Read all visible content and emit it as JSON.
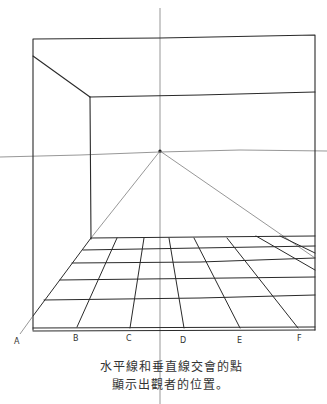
{
  "diagram": {
    "type": "one-point-perspective-sketch",
    "vanishing_point": {
      "x": 160,
      "y": 152
    },
    "horizon_line_y": 155,
    "vertical_line_x": 160,
    "floor_labels": [
      "A",
      "B",
      "C",
      "D",
      "E",
      "F"
    ],
    "caption_lines": [
      "水平線和垂直線交會的點",
      "顯示出觀者的位置。"
    ]
  }
}
